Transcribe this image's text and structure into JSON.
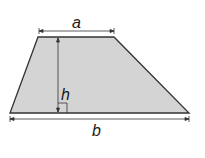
{
  "diagram": {
    "shape": "trapezoid",
    "fill_color": "#d4d4d4",
    "stroke_color": "#333333",
    "labels": {
      "top_base": "a",
      "bottom_base": "b",
      "height": "h"
    }
  }
}
